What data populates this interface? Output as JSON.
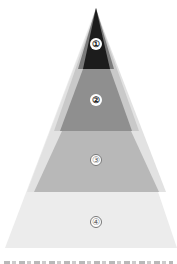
{
  "diagram": {
    "type": "pyramid",
    "layers": [
      {
        "label": "①",
        "color": "#1c1c1c",
        "label_style": "filled"
      },
      {
        "label": "②",
        "color": "#8f8f8f",
        "label_style": "filled"
      },
      {
        "label": "③",
        "color": "#b8b8b8",
        "label_style": "outlined"
      },
      {
        "label": "④",
        "color": "#ececec",
        "label_style": "outlined"
      }
    ],
    "halo_color": "#e6e6e6",
    "caption_note": "clipped caption text at bottom edge (illegible)"
  }
}
